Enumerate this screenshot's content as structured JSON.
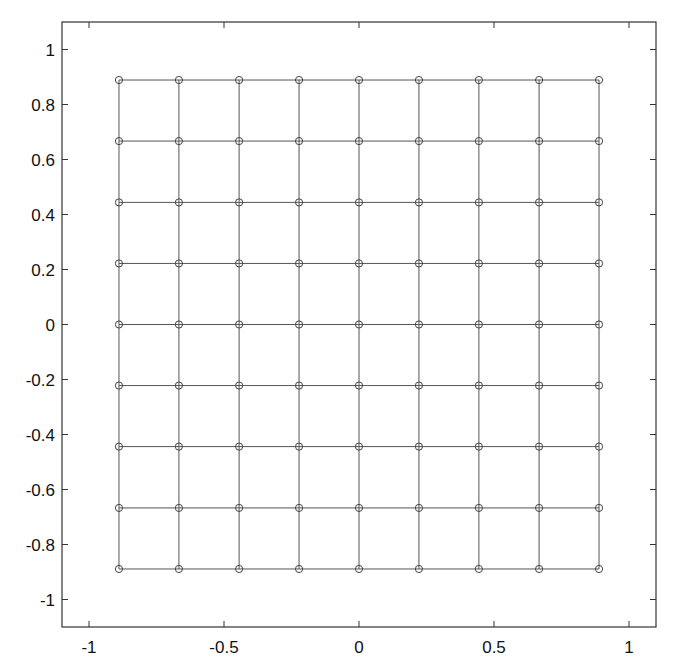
{
  "chart_data": {
    "type": "scatter",
    "title": "",
    "xlabel": "",
    "ylabel": "",
    "xlim": [
      -1.1,
      1.1
    ],
    "ylim": [
      -1.1,
      1.1
    ],
    "grid": false,
    "legend": null,
    "marker": "o",
    "connect_as_mesh": true,
    "mesh_size": [
      9,
      9
    ],
    "x_ticks": [
      -1,
      -0.5,
      0,
      0.5,
      1
    ],
    "x_tick_labels": [
      "-1",
      "-0.5",
      "0",
      "0.5",
      "1"
    ],
    "y_ticks": [
      1,
      0.8,
      0.6,
      0.4,
      0.2,
      0,
      -0.2,
      -0.4,
      -0.6,
      -0.8,
      -1
    ],
    "y_tick_labels": [
      "1",
      "0.8",
      "0.6",
      "0.4",
      "0.2",
      "0",
      "-0.2",
      "-0.4",
      "-0.6",
      "-0.8",
      "-1"
    ],
    "grid_coordinates": [
      -0.889,
      -0.667,
      -0.444,
      -0.222,
      0,
      0.222,
      0.444,
      0.667,
      0.889
    ],
    "series": [
      {
        "name": "mesh nodes",
        "description": "9x9 tensor-product grid of points (x_i, y_j), connected by horizontal and vertical line segments",
        "x": [
          -0.889,
          -0.667,
          -0.444,
          -0.222,
          0,
          0.222,
          0.444,
          0.667,
          0.889
        ],
        "y": [
          -0.889,
          -0.667,
          -0.444,
          -0.222,
          0,
          0.222,
          0.444,
          0.667,
          0.889
        ]
      }
    ]
  },
  "colors": {
    "line": "#555555",
    "marker": "#444444",
    "axes": "#333333",
    "background": "#ffffff"
  }
}
